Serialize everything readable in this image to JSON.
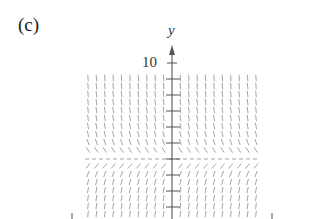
{
  "figure": {
    "panel_label": "(c)",
    "y_axis_label": "y",
    "y_tick_label": "10",
    "type": "slope-field",
    "colors": {
      "axis": "#555555",
      "segments": "#9a9a9a",
      "dashed": "#9a9a9a",
      "text": "#333333"
    }
  },
  "chart_data": {
    "type": "slope-field",
    "title": "(c)",
    "ylabel": "y",
    "tick_labels": [
      "10"
    ],
    "equilibrium": "horizontal dashed line"
  }
}
